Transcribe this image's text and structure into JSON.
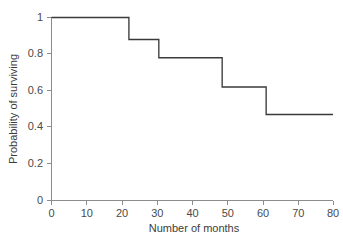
{
  "chart_data": {
    "type": "line",
    "subtype": "step-kaplan-meier",
    "title": "",
    "xlabel": "Number of months",
    "ylabel": "Probability of surviving",
    "xlim": [
      0,
      80
    ],
    "ylim": [
      0,
      1
    ],
    "grid": false,
    "legend": null,
    "legend_position": "none",
    "line_color": "#3a3a3a",
    "background_color": "#ffffff",
    "axis_color": "#8c8c8c",
    "xticks": [
      0,
      10,
      20,
      30,
      40,
      50,
      60,
      70,
      80
    ],
    "xtick_labels": [
      "0",
      "10",
      "20",
      "30",
      "40",
      "50",
      "60",
      "70",
      "80"
    ],
    "yticks": [
      0,
      0.2,
      0.4,
      0.6,
      0.8,
      1
    ],
    "ytick_labels": [
      "0",
      "0.2",
      "0.4",
      "0.6",
      "0.8",
      "1"
    ],
    "series": [
      {
        "name": "survival",
        "step": "post",
        "x": [
          0,
          22,
          22,
          30.5,
          30.5,
          48.5,
          48.5,
          61,
          61,
          80
        ],
        "y": [
          1.0,
          1.0,
          0.88,
          0.88,
          0.78,
          0.78,
          0.62,
          0.62,
          0.47,
          0.47
        ]
      }
    ],
    "step_events": [
      {
        "month": 22.0,
        "from": 1.0,
        "to": 0.88
      },
      {
        "month": 30.5,
        "from": 0.88,
        "to": 0.78
      },
      {
        "month": 48.5,
        "from": 0.78,
        "to": 0.62
      },
      {
        "month": 61.0,
        "from": 0.62,
        "to": 0.47
      }
    ]
  },
  "axes": {
    "x_title": "Number of months",
    "y_title": "Probability of surviving"
  }
}
